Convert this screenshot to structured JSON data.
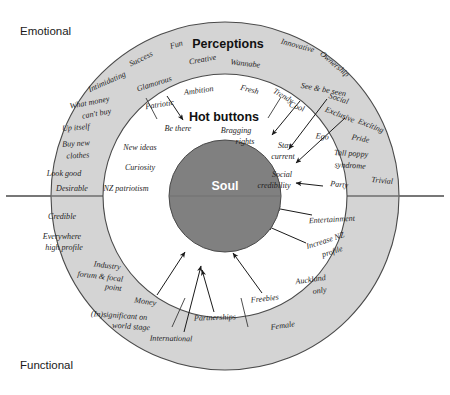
{
  "diagram": {
    "title_outer_ring": "Perceptions",
    "title_middle_ring": "Hot buttons",
    "title_core": "Soul",
    "axis_top_label": "Emotional",
    "axis_bottom_label": "Functional",
    "colors": {
      "outer_ring_fill": "#d4d4d4",
      "middle_ring_fill": "#ffffff",
      "core_fill": "#808080",
      "stroke": "#4a4a4a",
      "divider": "#6e6e6e",
      "text": "#1f1f1f",
      "core_text": "#ffffff"
    },
    "geometry": {
      "center_x": 225,
      "center_y": 196,
      "outer_radius": 174,
      "middle_radius": 122,
      "core_radius": 56
    }
  },
  "outer_ring_items": [
    {
      "text": "Fun",
      "x": 177,
      "y": 47,
      "rot": -16
    },
    {
      "text": "Success",
      "x": 142,
      "y": 61,
      "rot": -26
    },
    {
      "text": "Creative",
      "x": 203,
      "y": 62,
      "rot": -10
    },
    {
      "text": "Innovative",
      "x": 297,
      "y": 48,
      "rot": 15
    },
    {
      "text": "Ownership",
      "x": 333,
      "y": 66,
      "rot": 40
    },
    {
      "text": "Intimidating",
      "x": 108,
      "y": 84,
      "rot": -24
    },
    {
      "text": "Glamorous",
      "x": 155,
      "y": 86,
      "rot": -18
    },
    {
      "text": "Wannabe",
      "x": 245,
      "y": 66,
      "rot": 6
    },
    {
      "text": "Ambition",
      "x": 199,
      "y": 93,
      "rot": -8
    },
    {
      "text": "Fresh",
      "x": 249,
      "y": 92,
      "rot": 14
    },
    {
      "text": "Trendy",
      "x": 282,
      "y": 98,
      "rot": 30
    },
    {
      "text": "Cool",
      "x": 296,
      "y": 109,
      "rot": 20
    },
    {
      "text": "See & be seen",
      "x": 323,
      "y": 92,
      "rot": 11
    },
    {
      "text": "Social",
      "x": 338,
      "y": 101,
      "rot": 18
    },
    {
      "text": "Exclusive",
      "x": 339,
      "y": 117,
      "rot": 22
    },
    {
      "text": "What money",
      "x": 90,
      "y": 105,
      "rot": -11
    },
    {
      "text": "can't buy",
      "x": 97,
      "y": 116,
      "rot": -11
    },
    {
      "text": "Patriotic",
      "x": 160,
      "y": 107,
      "rot": -9
    },
    {
      "text": "Exciting",
      "x": 370,
      "y": 128,
      "rot": 22
    },
    {
      "text": "Pride",
      "x": 360,
      "y": 141,
      "rot": 12
    },
    {
      "text": "Ego",
      "x": 322,
      "y": 139,
      "rot": 6
    },
    {
      "text": "Up itself",
      "x": 76,
      "y": 130,
      "rot": -4
    },
    {
      "text": "Tall poppy",
      "x": 351,
      "y": 156,
      "rot": 3
    },
    {
      "text": "syndrome",
      "x": 350,
      "y": 168,
      "rot": 3
    },
    {
      "text": "Buy new",
      "x": 76,
      "y": 146,
      "rot": -3
    },
    {
      "text": "clothes",
      "x": 78,
      "y": 158,
      "rot": -3
    },
    {
      "text": "Look good",
      "x": 64,
      "y": 176,
      "rot": 0
    },
    {
      "text": "Party",
      "x": 339,
      "y": 187,
      "rot": 6
    },
    {
      "text": "Trivial",
      "x": 382,
      "y": 183,
      "rot": 5
    },
    {
      "text": "Desirable",
      "x": 72,
      "y": 191,
      "rot": 0
    },
    {
      "text": "Credible",
      "x": 62,
      "y": 219,
      "rot": 0
    },
    {
      "text": "Entertainment",
      "x": 332,
      "y": 222,
      "rot": -3
    },
    {
      "text": "Everywhere",
      "x": 62,
      "y": 239,
      "rot": 0
    },
    {
      "text": "high profile",
      "x": 64,
      "y": 250,
      "rot": 0
    },
    {
      "text": "Increase NZ",
      "x": 326,
      "y": 243,
      "rot": -18
    },
    {
      "text": "profile",
      "x": 333,
      "y": 254,
      "rot": -18
    },
    {
      "text": "Industry",
      "x": 107,
      "y": 268,
      "rot": 7
    },
    {
      "text": "forum & focal",
      "x": 100,
      "y": 279,
      "rot": 7
    },
    {
      "text": "point",
      "x": 113,
      "y": 290,
      "rot": 7
    },
    {
      "text": "Auckland",
      "x": 311,
      "y": 282,
      "rot": -8
    },
    {
      "text": "only",
      "x": 320,
      "y": 293,
      "rot": -8
    },
    {
      "text": "Freebies",
      "x": 265,
      "y": 301,
      "rot": -6
    },
    {
      "text": "Money",
      "x": 145,
      "y": 304,
      "rot": 9
    },
    {
      "text": "Partnerships",
      "x": 215,
      "y": 320,
      "rot": -2
    },
    {
      "text": "(In)significant on",
      "x": 119,
      "y": 318,
      "rot": 4
    },
    {
      "text": "world stage",
      "x": 131,
      "y": 329,
      "rot": 4
    },
    {
      "text": "Female",
      "x": 283,
      "y": 328,
      "rot": -8
    },
    {
      "text": "International",
      "x": 171,
      "y": 341,
      "rot": 1
    }
  ],
  "middle_ring_items": [
    {
      "text": "Be there",
      "x": 178,
      "y": 131,
      "rot": 0
    },
    {
      "text": "Bragging",
      "x": 236,
      "y": 133,
      "rot": 0
    },
    {
      "text": "rights",
      "x": 245,
      "y": 144,
      "rot": 0
    },
    {
      "text": "New ideas",
      "x": 140,
      "y": 150,
      "rot": 0
    },
    {
      "text": "Stay",
      "x": 285,
      "y": 148,
      "rot": 0
    },
    {
      "text": "current",
      "x": 283,
      "y": 159,
      "rot": 0
    },
    {
      "text": "Curiosity",
      "x": 140,
      "y": 170,
      "rot": 0
    },
    {
      "text": "Social",
      "x": 282,
      "y": 177,
      "rot": 0
    },
    {
      "text": "credibility",
      "x": 274,
      "y": 188,
      "rot": 0
    },
    {
      "text": "NZ patriotism",
      "x": 126,
      "y": 191,
      "rot": 0
    }
  ],
  "arrows": [
    {
      "name": "arrow-patriotic",
      "x1": 167,
      "y1": 96,
      "x2": 183,
      "y2": 120
    },
    {
      "name": "arrow-cool",
      "x1": 300,
      "y1": 101,
      "x2": 272,
      "y2": 135
    },
    {
      "name": "arrow-see-be-seen",
      "x1": 327,
      "y1": 99,
      "x2": 289,
      "y2": 149
    },
    {
      "name": "arrow-social-exclusive",
      "x1": 345,
      "y1": 118,
      "x2": 296,
      "y2": 163
    },
    {
      "name": "arrow-social-cred",
      "x1": 323,
      "y1": 186,
      "x2": 296,
      "y2": 183
    },
    {
      "name": "arrow-entertainment",
      "x1": 312,
      "y1": 215,
      "x2": 275,
      "y2": 208
    },
    {
      "name": "arrow-increase-nz",
      "x1": 306,
      "y1": 243,
      "x2": 267,
      "y2": 226
    },
    {
      "name": "arrow-freebies",
      "x1": 262,
      "y1": 293,
      "x2": 233,
      "y2": 253
    },
    {
      "name": "arrow-partnerships",
      "x1": 214,
      "y1": 312,
      "x2": 202,
      "y2": 270
    },
    {
      "name": "arrow-international",
      "x1": 184,
      "y1": 332,
      "x2": 201,
      "y2": 266
    },
    {
      "name": "arrow-money",
      "x1": 157,
      "y1": 295,
      "x2": 185,
      "y2": 252
    }
  ],
  "spokes": [
    {
      "name": "spoke-upper-left",
      "x1": 146,
      "y1": 98,
      "x2": 157,
      "y2": 119
    },
    {
      "name": "spoke-upper-right",
      "x1": 281,
      "y1": 97,
      "x2": 268,
      "y2": 118
    },
    {
      "name": "spoke-lower-left",
      "x1": 172,
      "y1": 327,
      "x2": 185,
      "y2": 298
    },
    {
      "name": "spoke-lower-right",
      "x1": 248,
      "y1": 327,
      "x2": 241,
      "y2": 298
    }
  ]
}
